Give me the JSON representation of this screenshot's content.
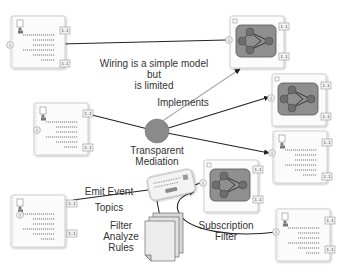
{
  "colors": {
    "background": "#ffffff",
    "card_border": "#cfcfcf",
    "card_fill": "#fbfbfb",
    "dash": "#555555",
    "port_fill": "#f2f2f2",
    "port_border": "#999999",
    "workflow_fill": "#8f8f8f",
    "workflow_border": "#555555",
    "workflow_node": "#6e6e6e",
    "mediation_fill": "#8a8a8a",
    "wire": "#222222",
    "implements_wire": "#aaaaaa",
    "text": "#333333"
  },
  "labels": {
    "wiring_note": "Wiring is a simple model\nbut\nis limited",
    "implements": "Implements",
    "mediation": "Transparent\nMediation",
    "emit_event": "Emit Event",
    "topics": "Topics",
    "rules": "Filter\nAnalyze\nRules",
    "subscription": "Subscription\nFilter"
  },
  "ports": {
    "cardinality": "1..1",
    "input_glyph": "i"
  },
  "nodes": [
    {
      "id": "component-top-left",
      "kind": "component"
    },
    {
      "id": "workflow-top",
      "kind": "workflow"
    },
    {
      "id": "component-mid-left",
      "kind": "component"
    },
    {
      "id": "workflow-right",
      "kind": "workflow"
    },
    {
      "id": "component-right",
      "kind": "component"
    },
    {
      "id": "workflow-bottom",
      "kind": "workflow"
    },
    {
      "id": "component-bottom-left",
      "kind": "component"
    },
    {
      "id": "component-bottom-right",
      "kind": "component"
    },
    {
      "id": "event-bus",
      "kind": "device"
    },
    {
      "id": "rules-documents",
      "kind": "documents"
    },
    {
      "id": "transparent-mediation",
      "kind": "mediator"
    }
  ]
}
